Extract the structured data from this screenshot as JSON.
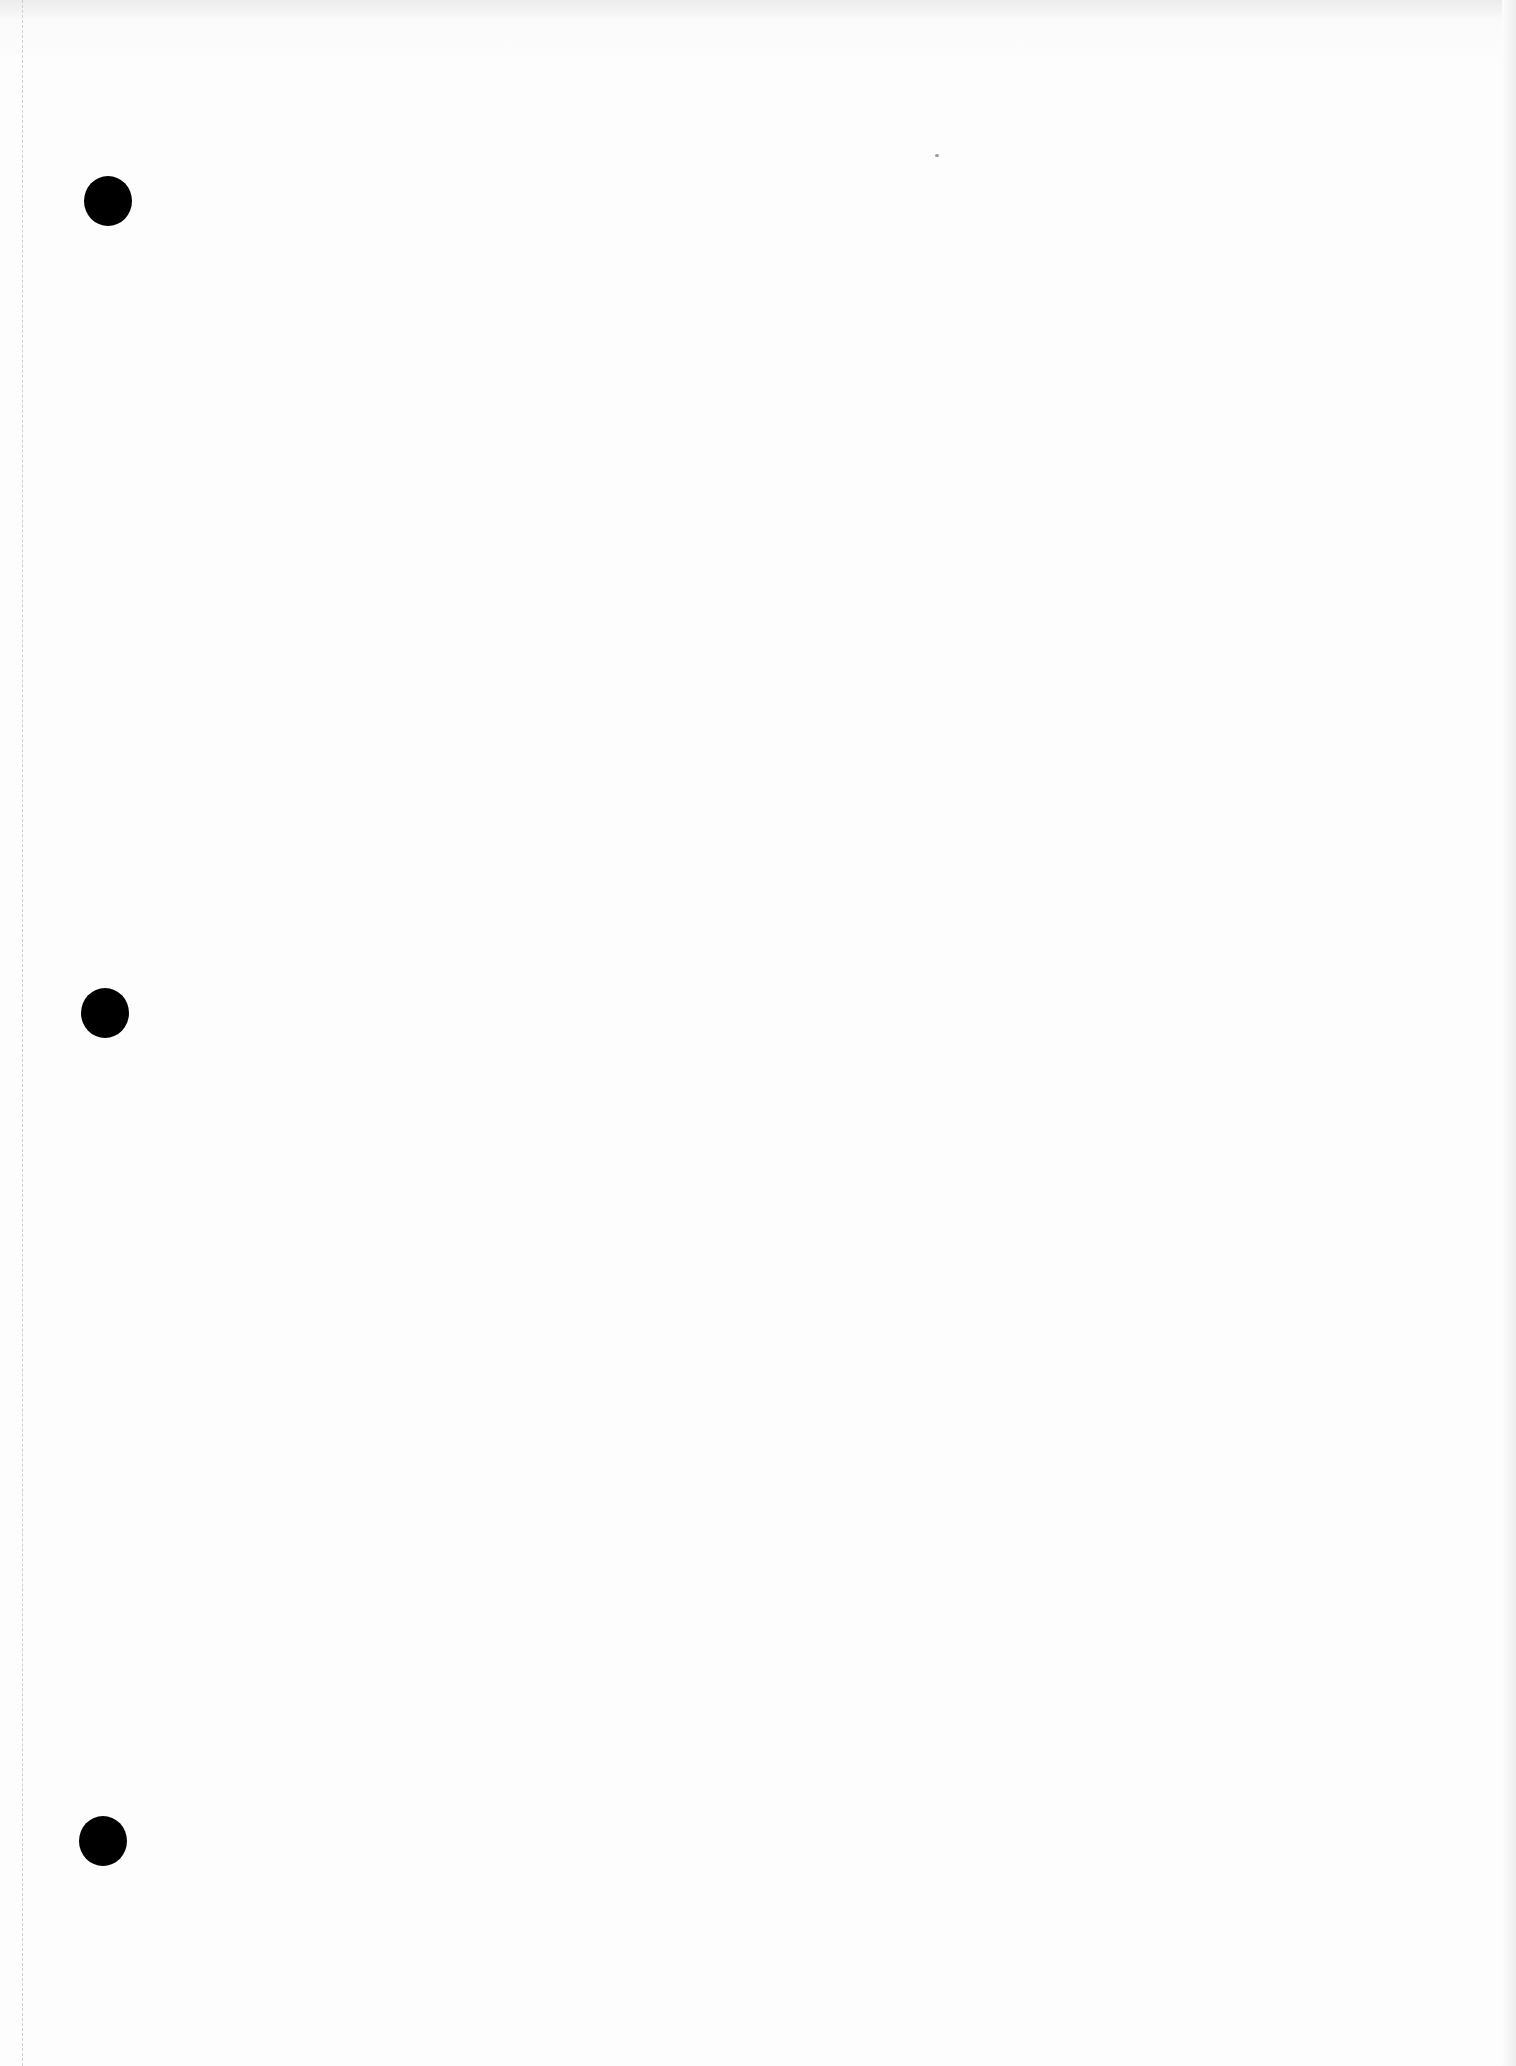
{
  "document": {
    "type": "scanned blank page",
    "punch_holes": [
      {
        "x": 108,
        "y": 200,
        "d": 50
      },
      {
        "x": 105,
        "y": 1012,
        "d": 50
      },
      {
        "x": 103,
        "y": 1840,
        "d": 50
      }
    ],
    "colors": {
      "paper": "#fdfdfd",
      "hole": "#000000"
    }
  }
}
